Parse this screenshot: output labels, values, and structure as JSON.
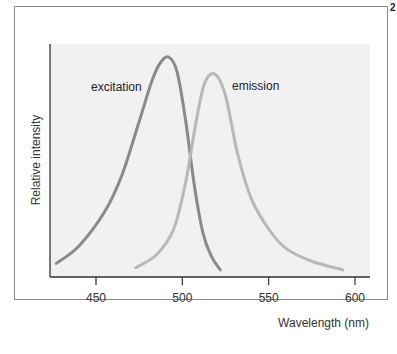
{
  "figure_number": "2",
  "chart_data": {
    "type": "line",
    "title": "",
    "xlabel": "Wavelength (nm)",
    "ylabel": "Relative intensity",
    "xlim": [
      423,
      608
    ],
    "ylim": [
      0,
      1
    ],
    "x_ticks": [
      450,
      500,
      550,
      600
    ],
    "x_tick_labels": [
      "450",
      "500",
      "550",
      "600"
    ],
    "grid": false,
    "legend": "inline labels",
    "series": [
      {
        "name": "excitation",
        "color": "#8a8a8a",
        "x": [
          427,
          440,
          455,
          465,
          475,
          482,
          487,
          492,
          497,
          502,
          507,
          512,
          517,
          522
        ],
        "y": [
          0.04,
          0.12,
          0.28,
          0.45,
          0.7,
          0.88,
          0.97,
          1.0,
          0.93,
          0.7,
          0.4,
          0.18,
          0.07,
          0.01
        ]
      },
      {
        "name": "emission",
        "color": "#b8b8b8",
        "x": [
          473,
          485,
          495,
          502,
          508,
          513,
          519,
          525,
          532,
          540,
          550,
          560,
          575,
          593
        ],
        "y": [
          0.02,
          0.08,
          0.2,
          0.42,
          0.7,
          0.88,
          0.92,
          0.82,
          0.55,
          0.34,
          0.2,
          0.11,
          0.05,
          0.01
        ]
      }
    ]
  }
}
